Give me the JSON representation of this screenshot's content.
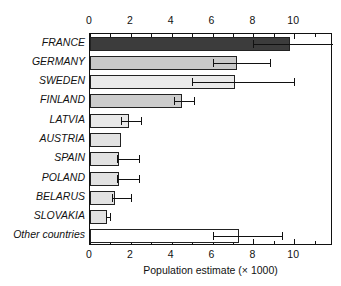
{
  "chart_data": {
    "type": "bar",
    "orientation": "horizontal",
    "title": "",
    "xlabel": "Population estimate (× 1000)",
    "ylabel": "",
    "xlim": [
      0,
      11.9
    ],
    "xticks": [
      0,
      2,
      4,
      6,
      8,
      10
    ],
    "xtick_labels": [
      "0",
      "2",
      "4",
      "6",
      "8",
      "10"
    ],
    "xminor_step": 1,
    "grid": false,
    "legend": null,
    "axis_on_both_sides": true,
    "categories": [
      "FRANCE",
      "GERMANY",
      "SWEDEN",
      "FINLAND",
      "LATVIA",
      "AUSTRIA",
      "SPAIN",
      "POLAND",
      "BELARUS",
      "SLOVAKIA",
      "Other countries"
    ],
    "values": [
      9.8,
      7.2,
      7.1,
      4.5,
      1.9,
      1.5,
      1.4,
      1.4,
      1.2,
      0.85,
      7.3
    ],
    "error_low": [
      8.0,
      6.0,
      5.0,
      4.1,
      1.5,
      null,
      1.3,
      1.3,
      1.1,
      0.8,
      6.0
    ],
    "error_high": [
      11.9,
      8.8,
      10.0,
      5.1,
      2.5,
      null,
      2.4,
      2.4,
      2.0,
      1.0,
      9.4
    ],
    "bar_colors": [
      "#3c3c3c",
      "#c9c9c9",
      "#eaeaea",
      "#cccccc",
      "#e9e9e9",
      "#e2e2e2",
      "#e2e2e2",
      "#e2e2e2",
      "#e2e2e2",
      "#e2e2e2",
      "#ffffff"
    ],
    "bar_edge_color": "#222222",
    "error_color": "#111111",
    "background": "#ffffff"
  },
  "axis": {
    "xlabel": "Population estimate (× 1000)"
  }
}
